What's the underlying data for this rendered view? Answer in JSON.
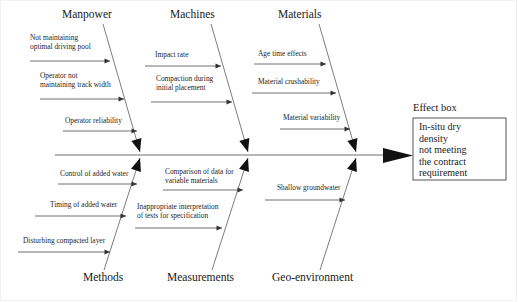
{
  "diagram": {
    "type": "fishbone-ishikawa",
    "title_visible": false,
    "spine": {
      "x1": 55,
      "x2": 383,
      "y": 155
    },
    "effect_caption": "Effect box",
    "effect_box": {
      "lines": [
        "In-situ dry",
        "density",
        "not meeting",
        "the contract",
        "requirement"
      ],
      "x": 413,
      "y": 118,
      "width": 93,
      "height": 62
    },
    "categories_top": [
      {
        "name": "Manpower",
        "label_x": 62,
        "label_y": 18,
        "branch": {
          "x_top": 103,
          "y_top": 24,
          "x_bottom": 140,
          "y_bottom": 152
        },
        "causes": [
          {
            "lines": [
              "Not maintaining",
              "optimal driving pool"
            ],
            "text_x": 30,
            "text_y": 40,
            "line_x1": 30,
            "line_x2": 110,
            "line_y": 61
          },
          {
            "lines": [
              "Operator not",
              "maintaining track width"
            ],
            "text_x": 40,
            "text_y": 78,
            "line_x1": 40,
            "line_x2": 124,
            "line_y": 99
          },
          {
            "lines": [
              "Operator reliability"
            ],
            "text_x": 65,
            "text_y": 123,
            "line_x1": 63,
            "line_x2": 137,
            "line_y": 131
          }
        ]
      },
      {
        "name": "Machines",
        "label_x": 170,
        "label_y": 18,
        "branch": {
          "x_top": 211,
          "y_top": 24,
          "x_bottom": 248,
          "y_bottom": 152
        },
        "causes": [
          {
            "lines": [
              "Impact rate"
            ],
            "text_x": 155,
            "text_y": 57,
            "line_x1": 145,
            "line_x2": 221,
            "line_y": 66
          },
          {
            "lines": [
              "Compaction during",
              "initial placement"
            ],
            "text_x": 156,
            "text_y": 81,
            "line_x1": 151,
            "line_x2": 232,
            "line_y": 102
          }
        ]
      },
      {
        "name": "Materials",
        "label_x": 278,
        "label_y": 18,
        "branch": {
          "x_top": 319,
          "y_top": 24,
          "x_bottom": 356,
          "y_bottom": 152
        },
        "causes": [
          {
            "lines": [
              "Age time effects"
            ],
            "text_x": 258,
            "text_y": 56,
            "line_x1": 254,
            "line_x2": 326,
            "line_y": 64
          },
          {
            "lines": [
              "Material crushability"
            ],
            "text_x": 258,
            "text_y": 84,
            "line_x1": 252,
            "line_x2": 336,
            "line_y": 93
          },
          {
            "lines": [
              "Material variability"
            ],
            "text_x": 283,
            "text_y": 120,
            "line_x1": 280,
            "line_x2": 350,
            "line_y": 129
          }
        ]
      }
    ],
    "categories_bottom": [
      {
        "name": "Methods",
        "label_x": 83,
        "label_y": 281,
        "branch": {
          "x_top": 140,
          "y_top": 158,
          "x_bottom": 104,
          "y_bottom": 270
        },
        "causes": [
          {
            "lines": [
              "Control of added water"
            ],
            "text_x": 60,
            "text_y": 176,
            "line_x1": 58,
            "line_x2": 137,
            "line_y": 184
          },
          {
            "lines": [
              "Timing of added water"
            ],
            "text_x": 50,
            "text_y": 207,
            "line_x1": 35,
            "line_x2": 126,
            "line_y": 216
          },
          {
            "lines": [
              "Disturbing compacted layer"
            ],
            "text_x": 23,
            "text_y": 243,
            "line_x1": 18,
            "line_x2": 110,
            "line_y": 252
          }
        ]
      },
      {
        "name": "Measurements",
        "label_x": 167,
        "label_y": 281,
        "branch": {
          "x_top": 248,
          "y_top": 158,
          "x_bottom": 212,
          "y_bottom": 270
        },
        "causes": [
          {
            "lines": [
              "Comparison of data for",
              "variable materials"
            ],
            "text_x": 165,
            "text_y": 174,
            "line_x1": 163,
            "line_x2": 243,
            "line_y": 190
          },
          {
            "lines": [
              "Inappropriate interpretation",
              "of tests for specification"
            ],
            "text_x": 137,
            "text_y": 209,
            "line_x1": 135,
            "line_x2": 222,
            "line_y": 228
          }
        ]
      },
      {
        "name": "Geo-environment",
        "label_x": 272,
        "label_y": 281,
        "branch": {
          "x_top": 356,
          "y_top": 158,
          "x_bottom": 320,
          "y_bottom": 270
        },
        "causes": [
          {
            "lines": [
              "Shallow groundwater"
            ],
            "text_x": 277,
            "text_y": 190,
            "line_x1": 265,
            "line_x2": 345,
            "line_y": 200
          }
        ]
      }
    ]
  }
}
